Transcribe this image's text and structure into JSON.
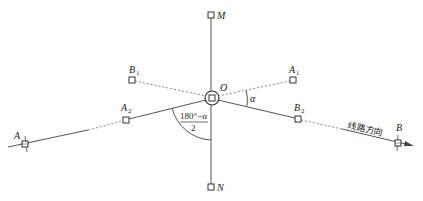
{
  "diagram": {
    "title": "",
    "points": {
      "M": {
        "label": "M",
        "x": 211,
        "y": 15
      },
      "N": {
        "label": "N",
        "x": 211,
        "y": 187
      },
      "O": {
        "label": "O",
        "x": 212,
        "y": 98
      },
      "A": {
        "label": "A",
        "x": 25,
        "y": 144
      },
      "B": {
        "label": "B",
        "x": 398,
        "y": 143
      },
      "A1": {
        "label": "A",
        "sub": "1",
        "x": 293,
        "y": 80
      },
      "B1": {
        "label": "B",
        "sub": "1",
        "x": 132,
        "y": 80
      },
      "A2": {
        "label": "A",
        "sub": "2",
        "x": 126,
        "y": 120
      },
      "B2": {
        "label": "B",
        "sub": "2",
        "x": 298,
        "y": 119
      }
    },
    "angle_alpha": "α",
    "angle_bisector_numerator": "180°−α",
    "angle_bisector_denominator": "2",
    "route_direction_label": "线路方向",
    "line_color": "#555555"
  }
}
